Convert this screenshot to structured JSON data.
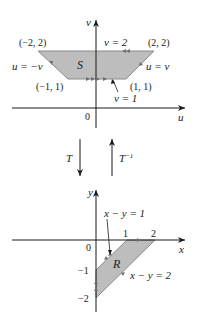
{
  "top_diagram": {
    "axis_labels": {
      "horizontal": "u",
      "vertical": "v",
      "origin": "0"
    },
    "region_label": "S",
    "vertices": {
      "top_left": "(−2, 2)",
      "top_right": "(2, 2)",
      "bottom_left": "(−1, 1)",
      "bottom_right": "(1, 1)"
    },
    "edge_labels": {
      "top": "v = 2",
      "left": "u = −v",
      "right": "u = v",
      "bottom": "v = 1"
    }
  },
  "transform": {
    "forward_label": "T",
    "inverse_label_base": "T",
    "inverse_label_exp": "−1"
  },
  "bottom_diagram": {
    "axis_labels": {
      "horizontal": "x",
      "vertical": "y",
      "origin": "0"
    },
    "region_label": "R",
    "x_ticks": [
      "1",
      "2"
    ],
    "y_ticks": [
      "−1",
      "−2"
    ],
    "edge_labels": {
      "upper": "x − y = 1",
      "lower": "x − y = 2"
    }
  },
  "colors": {
    "region_fill": "#bdbdbd",
    "region_stroke": "#8a8a8a",
    "axis": "#1a1a1a",
    "edge_arrow": "#7a7a7a"
  }
}
